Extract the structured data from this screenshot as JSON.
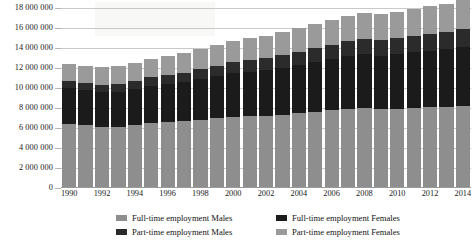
{
  "chart_data": {
    "type": "bar",
    "stacked": true,
    "title": "",
    "xlabel": "",
    "ylabel": "",
    "ylim": [
      0,
      18000000
    ],
    "ytick_step": 2000000,
    "grid": true,
    "legend_position": "bottom",
    "categories": [
      "1990",
      "1991",
      "1992",
      "1993",
      "1994",
      "1995",
      "1996",
      "1997",
      "1998",
      "1999",
      "2000",
      "2001",
      "2002",
      "2003",
      "2004",
      "2005",
      "2006",
      "2007",
      "2008",
      "2009",
      "2010",
      "2011",
      "2012",
      "2013",
      "2014"
    ],
    "xtick_labels": [
      "1990",
      "",
      "1992",
      "",
      "1994",
      "",
      "1996",
      "",
      "1998",
      "",
      "2000",
      "",
      "2002",
      "",
      "2004",
      "",
      "2006",
      "",
      "2008",
      "",
      "2010",
      "",
      "2012",
      "",
      "2014"
    ],
    "ytick_labels": [
      "0",
      "2 000 000",
      "4 000 000",
      "6 000 000",
      "8 000 000",
      "10 000 000",
      "12 000 000",
      "14 000 000",
      "16 000 000",
      "18 000 000"
    ],
    "ytick_values": [
      0,
      2000000,
      4000000,
      6000000,
      8000000,
      10000000,
      12000000,
      14000000,
      16000000,
      18000000
    ],
    "series": [
      {
        "name": "Full-time employment Males",
        "color": "#8e8e8e",
        "values": [
          6450000,
          6300000,
          6150000,
          6150000,
          6300000,
          6500000,
          6600000,
          6700000,
          6850000,
          7000000,
          7150000,
          7200000,
          7250000,
          7350000,
          7500000,
          7650000,
          7800000,
          7950000,
          8050000,
          7900000,
          7950000,
          8050000,
          8100000,
          8150000,
          8250000
        ]
      },
      {
        "name": "Full-time employment Females",
        "color": "#1b1b1b",
        "values": [
          3550000,
          3500000,
          3450000,
          3500000,
          3600000,
          3700000,
          3800000,
          3900000,
          4050000,
          4200000,
          4350000,
          4450000,
          4550000,
          4700000,
          4850000,
          5000000,
          5150000,
          5300000,
          5400000,
          5350000,
          5450000,
          5550000,
          5650000,
          5750000,
          5900000
        ]
      },
      {
        "name": "Part-time employment Males",
        "color": "#2b2b2b",
        "values": [
          700000,
          720000,
          740000,
          780000,
          820000,
          860000,
          900000,
          950000,
          1000000,
          1050000,
          1100000,
          1150000,
          1200000,
          1250000,
          1300000,
          1350000,
          1400000,
          1450000,
          1500000,
          1550000,
          1600000,
          1650000,
          1700000,
          1750000,
          1800000
        ]
      },
      {
        "name": "Part-time employment Females",
        "color": "#9a9a9a",
        "values": [
          1700000,
          1720000,
          1740000,
          1780000,
          1830000,
          1880000,
          1930000,
          1980000,
          2030000,
          2080000,
          2130000,
          2180000,
          2230000,
          2280000,
          2330000,
          2380000,
          2430000,
          2480000,
          2530000,
          2580000,
          2630000,
          2680000,
          2730000,
          2780000,
          2830000
        ]
      }
    ],
    "totals": [
      12400000,
      12240000,
      12080000,
      12210000,
      12550000,
      12940000,
      13230000,
      13530000,
      13930000,
      14330000,
      14730000,
      14980000,
      15230000,
      15580000,
      15980000,
      16380000,
      16780000,
      17180000,
      17480000,
      17380000,
      17630000,
      17930000,
      18180000,
      18430000,
      18780000
    ]
  },
  "legend": {
    "items": [
      {
        "label": "Full-time employment Males",
        "color": "#8e8e8e",
        "icon": "legend-swatch-icon"
      },
      {
        "label": "Full-time employment Females",
        "color": "#1b1b1b",
        "icon": "legend-swatch-icon"
      },
      {
        "label": "Part-time employment Males",
        "color": "#2b2b2b",
        "icon": "legend-swatch-icon"
      },
      {
        "label": "Part-time employment Females",
        "color": "#9a9a9a",
        "icon": "legend-swatch-icon"
      }
    ]
  },
  "colors": {
    "gridline": "#c9c9c9",
    "axis": "#9a9a9a",
    "text": "#1a1a1a",
    "background": "#ffffff"
  }
}
